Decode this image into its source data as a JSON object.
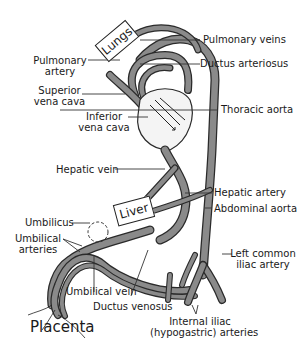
{
  "diagram": {
    "colors": {
      "vessel_fill": "#8a8a8a",
      "vessel_outline": "#2a2a2a",
      "line": "#333333",
      "background": "#ffffff",
      "heart_fill": "#f4f4f4"
    },
    "organs": {
      "lungs": "Lungs",
      "liver": "Liver",
      "placenta": "Placenta"
    },
    "labels": {
      "pulmonary_veins": "Pulmonary veins",
      "pulmonary_artery_1": "Pulmonary",
      "pulmonary_artery_2": "artery",
      "ductus_arteriosus": "Ductus arteriosus",
      "superior_vena_cava_1": "Superior",
      "superior_vena_cava_2": "vena cava",
      "inferior_vena_cava_1": "Inferior",
      "inferior_vena_cava_2": "vena cava",
      "thoracic_aorta": "Thoracic aorta",
      "hepatic_vein": "Hepatic vein",
      "hepatic_artery": "Hepatic artery",
      "abdominal_aorta": "Abdominal aorta",
      "umbilicus": "Umbilicus",
      "umbilical_arteries_1": "Umbilical",
      "umbilical_arteries_2": "arteries",
      "left_common_iliac_1": "Left common",
      "left_common_iliac_2": "iliac artery",
      "umbilical_vein": "Umbilical vein",
      "ductus_venosus": "Ductus venosus",
      "internal_iliac_1": "Internal iliac",
      "internal_iliac_2": "(hypogastric) arteries"
    }
  }
}
